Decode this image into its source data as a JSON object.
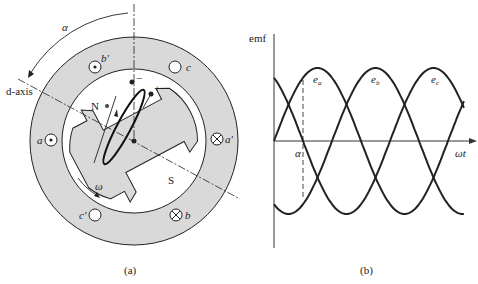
{
  "figure_a": {
    "caption": "(a)",
    "d_axis_label": "d-axis",
    "angle_label": "α",
    "north_label": "N",
    "south_label": "S",
    "speed_label": "ω",
    "terminal_minus": "−",
    "terminal_plus": "+",
    "slots": [
      {
        "label": "a",
        "symbol": "dot"
      },
      {
        "label": "a'",
        "symbol": "cross"
      },
      {
        "label": "b",
        "symbol": "cross"
      },
      {
        "label": "b'",
        "symbol": "dot"
      },
      {
        "label": "c",
        "symbol": "empty"
      },
      {
        "label": "c'",
        "symbol": "empty"
      }
    ],
    "colors": {
      "iron": "#d9d9d9",
      "line": "#222222"
    }
  },
  "figure_b": {
    "caption": "(b)",
    "y_axis_label": "emf",
    "x_axis_label": "ωt",
    "marker_label": "α",
    "curve_labels": [
      "e_a",
      "e_b",
      "e_c"
    ]
  },
  "chart_data": {
    "type": "line",
    "title": "",
    "xlabel": "ωt",
    "ylabel": "emf",
    "x_unit": "degrees",
    "x_range": [
      0,
      393
    ],
    "y_range": [
      -1,
      1
    ],
    "grid": false,
    "annotations": [
      {
        "text": "α",
        "x": 60,
        "style": "dashed vertical line"
      }
    ],
    "series": [
      {
        "name": "e_a",
        "function": "sin(ωt)",
        "phase_deg": 0,
        "amplitude": 1
      },
      {
        "name": "e_b",
        "function": "sin(ωt - 120°)",
        "phase_deg": -120,
        "amplitude": 1
      },
      {
        "name": "e_c",
        "function": "sin(ωt - 240°)",
        "phase_deg": -240,
        "amplitude": 1
      }
    ]
  }
}
